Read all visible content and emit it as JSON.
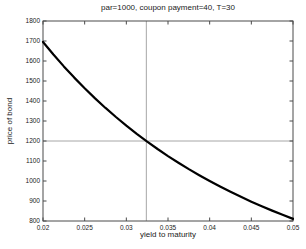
{
  "chart_data": {
    "type": "line",
    "title": "par=1000, coupon payment=40, T=30",
    "xlabel": "yield to maturity",
    "ylabel": "price of bond",
    "xlim": [
      0.02,
      0.05
    ],
    "ylim": [
      800,
      1800
    ],
    "grid": false,
    "x_tick_values": [
      0.02,
      0.025,
      0.03,
      0.035,
      0.04,
      0.045,
      0.05
    ],
    "x_tick_labels": [
      "0.02",
      "0.025",
      "0.03",
      "0.035",
      "0.04",
      "0.045",
      "0.05"
    ],
    "y_tick_values": [
      800,
      900,
      1000,
      1100,
      1200,
      1300,
      1400,
      1500,
      1600,
      1700,
      1800
    ],
    "y_tick_labels": [
      "800",
      "900",
      "1000",
      "1100",
      "1200",
      "1300",
      "1400",
      "1500",
      "1600",
      "1700",
      "1800"
    ],
    "x": [
      0.02,
      0.02125,
      0.0225,
      0.02375,
      0.025,
      0.02625,
      0.0275,
      0.02875,
      0.03,
      0.03125,
      0.0325,
      0.03375,
      0.035,
      0.03625,
      0.0375,
      0.03875,
      0.04,
      0.04125,
      0.0425,
      0.04375,
      0.045,
      0.04625,
      0.0475,
      0.04875,
      0.05
    ],
    "series": [
      {
        "name": "bond price",
        "values": [
          1695.2,
          1632.5,
          1573.1,
          1516.9,
          1463.6,
          1413.2,
          1365.3,
          1319.9,
          1276.8,
          1235.8,
          1196.9,
          1159.9,
          1124.7,
          1091.2,
          1059.3,
          1029.0,
          1000.0,
          972.4,
          946.0,
          920.9,
          896.8,
          873.8,
          851.9,
          830.8,
          810.7
        ],
        "color": "#000000",
        "line_width": 2.2
      }
    ],
    "crosshair": {
      "x": 0.0324,
      "y": 1200,
      "color": "#9c9c9c"
    },
    "colors": {
      "axis": "#4a4a4a",
      "tick_label": "#222222",
      "background": "#ffffff"
    }
  }
}
